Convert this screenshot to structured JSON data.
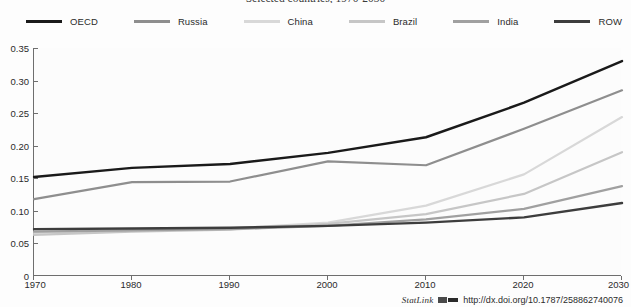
{
  "chart_data": {
    "type": "line",
    "title": "Selected countries, 1970-2030",
    "xlabel": "",
    "ylabel": "",
    "x": [
      1970,
      1980,
      1990,
      2000,
      2010,
      2020,
      2030
    ],
    "categories": [
      "1970",
      "1980",
      "1990",
      "2000",
      "2010",
      "2020",
      "2030"
    ],
    "xlim": [
      1970,
      2030
    ],
    "ylim": [
      0,
      0.35
    ],
    "ytick_labels": [
      "0",
      "0.05",
      "0.10",
      "0.15",
      "0.20",
      "0.25",
      "0.30",
      "0.35"
    ],
    "ytick_values": [
      0,
      0.05,
      0.1,
      0.15,
      0.2,
      0.25,
      0.3,
      0.35
    ],
    "grid": false,
    "legend_position": "top",
    "series": [
      {
        "name": "OECD",
        "color": "#1a1a1a",
        "width": 2.4,
        "values": [
          0.152,
          0.166,
          0.172,
          0.189,
          0.213,
          0.266,
          0.33
        ]
      },
      {
        "name": "Russia",
        "color": "#8e8e8e",
        "width": 2.2,
        "values": [
          0.118,
          0.144,
          0.145,
          0.176,
          0.17,
          0.226,
          0.285
        ]
      },
      {
        "name": "China",
        "color": "#d8d8d8",
        "width": 2.2,
        "values": [
          0.066,
          0.07,
          0.073,
          0.082,
          0.108,
          0.156,
          0.244
        ]
      },
      {
        "name": "Brazil",
        "color": "#c6c6c6",
        "width": 2.2,
        "values": [
          0.063,
          0.068,
          0.071,
          0.08,
          0.095,
          0.126,
          0.19
        ]
      },
      {
        "name": "India",
        "color": "#a0a0a0",
        "width": 2.2,
        "values": [
          0.068,
          0.07,
          0.072,
          0.077,
          0.087,
          0.103,
          0.138
        ]
      },
      {
        "name": "ROW",
        "color": "#3d3d3d",
        "width": 2.4,
        "values": [
          0.072,
          0.073,
          0.074,
          0.077,
          0.082,
          0.09,
          0.112
        ]
      }
    ]
  },
  "legend": {
    "items": [
      {
        "label": "OECD",
        "color": "#1a1a1a"
      },
      {
        "label": "Russia",
        "color": "#8e8e8e"
      },
      {
        "label": "China",
        "color": "#d8d8d8"
      },
      {
        "label": "Brazil",
        "color": "#c6c6c6"
      },
      {
        "label": "India",
        "color": "#a0a0a0"
      },
      {
        "label": "ROW",
        "color": "#3d3d3d"
      }
    ]
  },
  "footer": {
    "statlink_label": "StatLink",
    "url": "http://dx.doi.org/10.1787/258862740076"
  },
  "colors": {
    "axis": "#6e6e6e",
    "text": "#2b2b2b",
    "plot_background": "#fcfcfc",
    "page_background": "#fdfdfd"
  }
}
